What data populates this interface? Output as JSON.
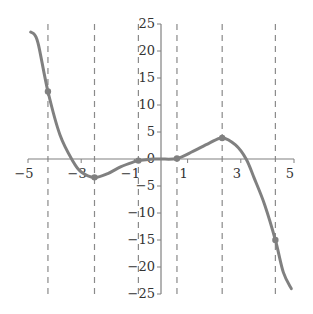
{
  "chart_data": {
    "type": "line",
    "title": "",
    "xlabel": "",
    "ylabel": "",
    "xlim": [
      -5,
      5
    ],
    "ylim": [
      -25,
      25
    ],
    "grid": false,
    "legend": null,
    "x_ticks": [
      -5,
      -3,
      -1,
      1,
      3,
      5
    ],
    "x_tick_labels": [
      "-5",
      "-3",
      "-1",
      "1",
      "3",
      "5"
    ],
    "y_ticks": [
      25,
      20,
      15,
      10,
      5,
      0,
      -5,
      -10,
      -15,
      -20,
      -25
    ],
    "y_tick_labels": [
      "25",
      "20",
      "15",
      "10",
      "5",
      "0",
      "-5",
      "-10",
      "-15",
      "-20",
      "-25"
    ],
    "curve_color": "#808080",
    "axis_color": "#808080",
    "vline_color": "#8a8a8a",
    "series": [
      {
        "name": "f(x)",
        "x": [
          -4.9,
          -4.75,
          -4.6,
          -4.25,
          -3.8,
          -3.3,
          -3.0,
          -2.5,
          -2.0,
          -1.5,
          -1.0,
          -0.85,
          -0.3,
          0.0,
          0.6,
          1.2,
          1.8,
          2.3,
          2.8,
          3.2,
          3.5,
          3.9,
          4.3,
          4.6,
          4.9
        ],
        "y": [
          23.5,
          23.0,
          21.0,
          12.5,
          4.5,
          -0.5,
          -2.4,
          -3.4,
          -2.7,
          -1.4,
          -0.5,
          -0.3,
          0.0,
          0.0,
          0.1,
          1.4,
          2.9,
          3.9,
          2.6,
          0.0,
          -3.5,
          -8.5,
          -15.0,
          -21.0,
          -24.0
        ]
      }
    ],
    "marked_points": [
      {
        "x": -4.25,
        "y": 12.5
      },
      {
        "x": -2.5,
        "y": -3.4
      },
      {
        "x": -0.85,
        "y": -0.3
      },
      {
        "x": 0.6,
        "y": 0.1
      },
      {
        "x": 2.3,
        "y": 3.9
      },
      {
        "x": 4.3,
        "y": -15.0
      }
    ],
    "vertical_dashed_lines_x": [
      -4.25,
      -2.5,
      -0.85,
      0.6,
      2.3,
      4.3
    ]
  }
}
